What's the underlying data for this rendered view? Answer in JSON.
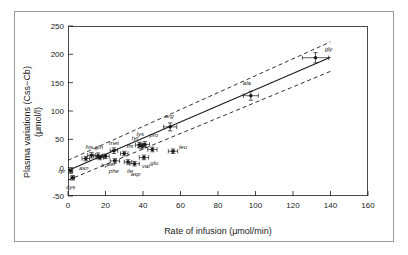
{
  "chart_data": {
    "type": "scatter",
    "title": "",
    "xlabel": "Rate of infusion (μmol/min)",
    "ylabel_line1": "Plasma variations (Css−Cb)",
    "ylabel_line2": "(μmol/l)",
    "xlim": [
      0,
      160
    ],
    "ylim": [
      -50,
      250
    ],
    "xticks": [
      0,
      20,
      40,
      60,
      80,
      100,
      120,
      140,
      160
    ],
    "yticks": [
      -50,
      0,
      50,
      100,
      150,
      200,
      250
    ],
    "grid": false,
    "legend": "none",
    "marker": "filled-circle-with-error-bars",
    "point_color": "#1a1a1a",
    "line_color": "#1a1a1a",
    "band_color": "#1a1a1a",
    "points": [
      {
        "label": "tyr",
        "x": 1.5,
        "y": -6,
        "xerr": 1.0,
        "yerr": 4,
        "lx": -9,
        "ly": 0
      },
      {
        "label": "cys",
        "x": 2.5,
        "y": -18,
        "xerr": 1.0,
        "yerr": 4,
        "lx": -2,
        "ly": 9
      },
      {
        "label": "asn",
        "x": 9.5,
        "y": 16,
        "xerr": 2.0,
        "yerr": 4,
        "lx": -2,
        "ly": 9
      },
      {
        "label": "his",
        "x": 12.5,
        "y": 22,
        "xerr": 2.0,
        "yerr": 5,
        "lx": -2,
        "ly": -8
      },
      {
        "label": "gln",
        "x": 16.0,
        "y": 21,
        "xerr": 2.5,
        "yerr": 5,
        "lx": 1,
        "ly": -9
      },
      {
        "label": "trp",
        "x": 17.0,
        "y": 18,
        "xerr": 2.0,
        "yerr": 4,
        "lx": 5,
        "ly": 8
      },
      {
        "label": "ser",
        "x": 20.0,
        "y": 20,
        "xerr": 2.0,
        "yerr": 4,
        "lx": 6,
        "ly": 8
      },
      {
        "label": "met",
        "x": 24.5,
        "y": 30,
        "xerr": 2.0,
        "yerr": 5,
        "lx": 0,
        "ly": -8
      },
      {
        "label": "phe",
        "x": 25.0,
        "y": 12,
        "xerr": 2.5,
        "yerr": 4,
        "lx": -1,
        "ly": 10
      },
      {
        "label": "thr",
        "x": 30.0,
        "y": 25,
        "xerr": 2.0,
        "yerr": 4,
        "lx": 6,
        "ly": -8
      },
      {
        "label": "ile",
        "x": 32.0,
        "y": 10,
        "xerr": 2.0,
        "yerr": 4,
        "lx": 2,
        "ly": 9
      },
      {
        "label": "asp",
        "x": 35.5,
        "y": 7,
        "xerr": 2.5,
        "yerr": 4,
        "lx": 1,
        "ly": 10
      },
      {
        "label": "lys",
        "x": 38.0,
        "y": 40,
        "xerr": 2.0,
        "yerr": 5,
        "lx": 1,
        "ly": -11
      },
      {
        "label": "tyr2",
        "x": 39.5,
        "y": 38,
        "xerr": 2.0,
        "yerr": 5,
        "lx": -7,
        "ly": -8
      },
      {
        "label": "pro",
        "x": 41.0,
        "y": 41,
        "xerr": 2.5,
        "yerr": 5,
        "lx": 9,
        "ly": -9
      },
      {
        "label": "val",
        "x": 40.5,
        "y": 18,
        "xerr": 2.5,
        "yerr": 4,
        "lx": 2,
        "ly": 9
      },
      {
        "label": "glu",
        "x": 45.0,
        "y": 32,
        "xerr": 2.5,
        "yerr": 4,
        "lx": 2,
        "ly": 13
      },
      {
        "label": "leu",
        "x": 56.0,
        "y": 29,
        "xerr": 2.5,
        "yerr": 4,
        "lx": 10,
        "ly": -4
      },
      {
        "label": "arg",
        "x": 54.5,
        "y": 72,
        "xerr": 3.5,
        "yerr": 7,
        "lx": -1,
        "ly": -11
      },
      {
        "label": "ala",
        "x": 97.5,
        "y": 127,
        "xerr": 4.0,
        "yerr": 8,
        "lx": -4,
        "ly": -13
      },
      {
        "label": "gly",
        "x": 132.0,
        "y": 194,
        "xerr": 7.0,
        "yerr": 9,
        "lx": 13,
        "ly": -9
      }
    ],
    "fit_line": {
      "x0": 0,
      "y0": -5,
      "x1": 140,
      "y1": 195
    },
    "upper_band": {
      "x0": 0,
      "y0": 13,
      "x1": 140,
      "y1": 222
    },
    "lower_band": {
      "x0": 0,
      "y0": -22,
      "x1": 140,
      "y1": 170
    }
  }
}
